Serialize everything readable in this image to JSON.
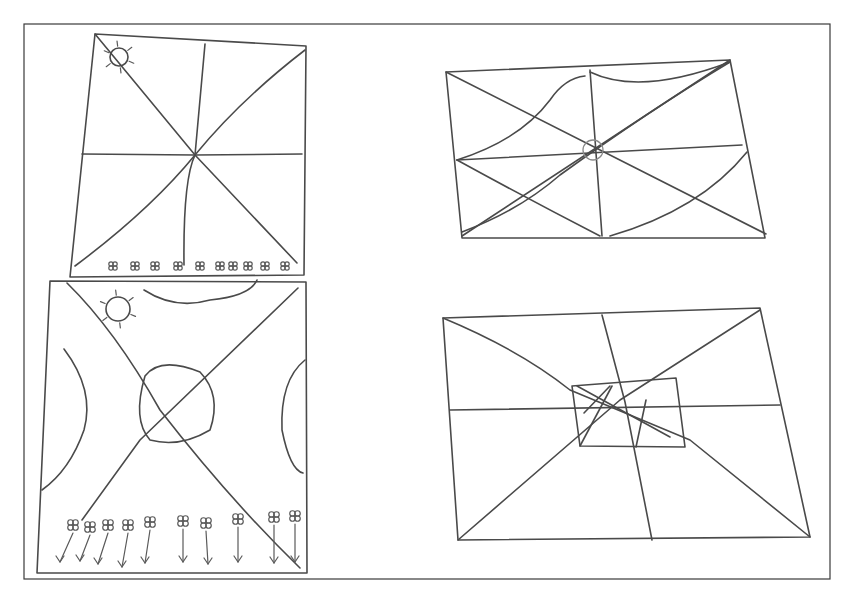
{
  "figure": {
    "width": 849,
    "height": 606,
    "background": "#ffffff",
    "ink_color": "#4a4a4a",
    "outer_frame": {
      "x": 24,
      "y": 24,
      "w": 806,
      "h": 555
    }
  },
  "panels": [
    {
      "id": "top-left",
      "description": "Square with sun in top-left corner, 8 radial lines meeting at center, row of small flowers along bottom edge",
      "outline": "M95,34 L306,46 L304,275 L70,277 Z",
      "lines": [
        "M95,34 L195,155",
        "M195,155 L297,263",
        "M305,50 Q240,100 195,155",
        "M195,155 Q150,210 75,266",
        "M205,44 L195,155",
        "M195,155 Q183,180 184,265",
        "M82,154 L195,155",
        "M195,155 L302,154"
      ],
      "sun": {
        "cx": 119,
        "cy": 57,
        "r": 9
      },
      "flower_row_y": 266,
      "flower_xs": [
        113,
        135,
        155,
        178,
        200,
        220,
        233,
        248,
        265,
        285
      ]
    },
    {
      "id": "bottom-left",
      "description": "Square with sun, two crossing diagonals, central rounded blob, curved arcs on edges, row of flowers with downward arrows",
      "outline": "M50,281 L306,282 L307,573 L37,573 Z",
      "lines": [
        "M67,283 Q115,330 160,410 Q230,500 300,568",
        "M298,288 L140,440 L82,520",
        "M145,376 Q160,356 200,372 Q222,395 210,430 Q180,448 150,440 Q132,420 145,376",
        "M144,290 Q175,310 210,300 Q250,296 257,280",
        "M64,349 Q95,390 84,430 Q70,470 42,490",
        "M305,360 Q280,380 282,430 Q290,470 303,473"
      ],
      "sun": {
        "cx": 118,
        "cy": 309,
        "r": 12
      },
      "flowers": [
        {
          "x": 73,
          "y": 525,
          "ax": 60,
          "ay": 562
        },
        {
          "x": 90,
          "y": 527,
          "ax": 80,
          "ay": 561
        },
        {
          "x": 108,
          "y": 525,
          "ax": 98,
          "ay": 564
        },
        {
          "x": 128,
          "y": 525,
          "ax": 122,
          "ay": 567
        },
        {
          "x": 150,
          "y": 522,
          "ax": 145,
          "ay": 563
        },
        {
          "x": 183,
          "y": 521,
          "ax": 183,
          "ay": 562
        },
        {
          "x": 206,
          "y": 523,
          "ax": 208,
          "ay": 564
        },
        {
          "x": 238,
          "y": 519,
          "ax": 238,
          "ay": 562
        },
        {
          "x": 274,
          "y": 517,
          "ax": 274,
          "ay": 563
        },
        {
          "x": 295,
          "y": 516,
          "ax": 295,
          "ay": 562
        }
      ]
    },
    {
      "id": "top-right",
      "description": "Parallelogram with diagonals, midlines, curved lens-shaped lines and small circle at center",
      "outline": "M446,72 L730,60 L765,238 L462,238 Z",
      "lines": [
        "M446,72 L766,234",
        "M730,60 L462,236",
        "M590,70 L602,236",
        "M457,160 L742,145",
        "M457,160 Q520,140 550,100 Q565,78 585,76",
        "M462,232 Q520,210 560,175 Q650,110 730,62",
        "M457,160 Q530,200 600,236",
        "M730,62 Q640,96 590,72",
        "M610,236 Q700,210 747,152"
      ],
      "center_circle": {
        "cx": 593,
        "cy": 150,
        "r": 10
      }
    },
    {
      "id": "bottom-right",
      "description": "Parallelogram with diagonals, midlines and inner small rectangle containing crossed diagonals",
      "outline": "M443,318 L760,308 L810,537 L458,540 Z",
      "lines": [
        "M443,318 Q520,350 570,390 L690,440 L810,537",
        "M760,310 L620,400 L458,540",
        "M602,315 L625,402 L652,540",
        "M450,410 L780,405",
        "M572,386 L676,378 L685,447 L580,446 Z",
        "M577,386 L670,437",
        "M612,386 L580,446",
        "M646,400 L636,447",
        "M584,413 L610,386"
      ]
    }
  ]
}
